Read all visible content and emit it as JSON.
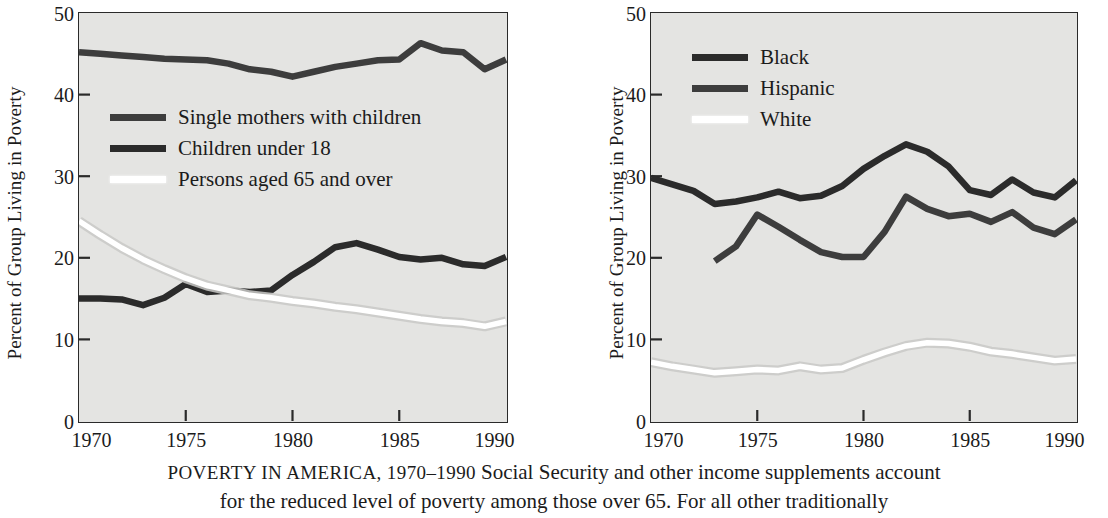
{
  "figure": {
    "caption_heading": "POVERTY IN AMERICA, 1970–1990",
    "caption_body_line1": "Social Security and other income supplements account",
    "caption_body_line2": "for the reduced level of poverty among those over 65. For all other traditionally"
  },
  "colors": {
    "plot_background": "#e4e4e2",
    "axis": "#2a2a2a",
    "series_dark": "#2b2b2b",
    "series_mid": "#3d3d3d",
    "series_white": "#ffffff",
    "text": "#1b1b1b"
  },
  "chart_data": [
    {
      "id": "left",
      "type": "line",
      "title": "",
      "xlabel": "",
      "ylabel": "Percent of Group Living in Poverty",
      "xlim": [
        1970,
        1990
      ],
      "ylim": [
        0,
        50
      ],
      "xticks": [
        1970,
        1975,
        1980,
        1985,
        1990
      ],
      "yticks": [
        0,
        10,
        20,
        30,
        40,
        50
      ],
      "xtick_labels": [
        "1970",
        "1975",
        "1980",
        "1985",
        "1990"
      ],
      "ytick_labels": [
        "0",
        "10",
        "20",
        "30",
        "40",
        "50"
      ],
      "grid": false,
      "legend_position": "upper-left-inside",
      "series": [
        {
          "name": "Single mothers with children",
          "color": "#3d3d3d",
          "x": [
            1970,
            1971,
            1972,
            1973,
            1974,
            1975,
            1976,
            1977,
            1978,
            1979,
            1980,
            1981,
            1982,
            1983,
            1984,
            1985,
            1986,
            1987,
            1988,
            1989,
            1990
          ],
          "values": [
            45.2,
            45.0,
            44.8,
            44.6,
            44.4,
            44.3,
            44.2,
            43.8,
            43.1,
            42.8,
            42.2,
            42.8,
            43.4,
            43.8,
            44.2,
            44.3,
            46.3,
            45.4,
            45.2,
            43.1,
            44.3
          ]
        },
        {
          "name": "Children under 18",
          "color": "#2b2b2b",
          "x": [
            1970,
            1971,
            1972,
            1973,
            1974,
            1975,
            1976,
            1977,
            1978,
            1979,
            1980,
            1981,
            1982,
            1983,
            1984,
            1985,
            1986,
            1987,
            1988,
            1989,
            1990
          ],
          "values": [
            15.0,
            15.0,
            14.9,
            14.2,
            15.1,
            16.8,
            15.8,
            16.0,
            15.8,
            16.0,
            17.9,
            19.5,
            21.3,
            21.8,
            21.0,
            20.1,
            19.8,
            20.0,
            19.2,
            19.0,
            20.1
          ]
        },
        {
          "name": "Persons aged 65 and over",
          "color": "#ffffff",
          "x": [
            1970,
            1971,
            1972,
            1973,
            1974,
            1975,
            1976,
            1977,
            1978,
            1979,
            1980,
            1981,
            1982,
            1983,
            1984,
            1985,
            1986,
            1987,
            1988,
            1989,
            1990
          ],
          "values": [
            24.5,
            22.8,
            21.2,
            19.8,
            18.6,
            17.5,
            16.6,
            16.0,
            15.4,
            15.1,
            14.7,
            14.4,
            14.0,
            13.7,
            13.3,
            12.9,
            12.5,
            12.2,
            12.0,
            11.6,
            12.2
          ]
        }
      ]
    },
    {
      "id": "right",
      "type": "line",
      "title": "",
      "xlabel": "",
      "ylabel": "Percent of Group Living in Poverty",
      "xlim": [
        1970,
        1990
      ],
      "ylim": [
        0,
        50
      ],
      "xticks": [
        1970,
        1975,
        1980,
        1985,
        1990
      ],
      "yticks": [
        0,
        10,
        20,
        30,
        40,
        50
      ],
      "xtick_labels": [
        "1970",
        "1975",
        "1980",
        "1985",
        "1990"
      ],
      "ytick_labels": [
        "0",
        "10",
        "20",
        "30",
        "40",
        "50"
      ],
      "grid": false,
      "legend_position": "upper-left-inside",
      "series": [
        {
          "name": "Black",
          "color": "#2b2b2b",
          "x": [
            1970,
            1971,
            1972,
            1973,
            1974,
            1975,
            1976,
            1977,
            1978,
            1979,
            1980,
            1981,
            1982,
            1983,
            1984,
            1985,
            1986,
            1987,
            1988,
            1989,
            1990
          ],
          "values": [
            29.8,
            29.0,
            28.2,
            26.6,
            26.9,
            27.4,
            28.1,
            27.3,
            27.6,
            28.8,
            30.9,
            32.5,
            33.9,
            33.0,
            31.2,
            28.3,
            27.7,
            29.6,
            28.0,
            27.4,
            29.5
          ]
        },
        {
          "name": "Hispanic",
          "color": "#3d3d3d",
          "x": [
            1973,
            1974,
            1975,
            1976,
            1977,
            1978,
            1979,
            1980,
            1981,
            1982,
            1983,
            1984,
            1985,
            1986,
            1987,
            1988,
            1989,
            1990
          ],
          "values": [
            19.6,
            21.4,
            25.3,
            23.8,
            22.2,
            20.7,
            20.1,
            20.1,
            23.2,
            27.5,
            26.0,
            25.1,
            25.4,
            24.4,
            25.6,
            23.7,
            22.9,
            24.7
          ]
        },
        {
          "name": "White",
          "color": "#ffffff",
          "x": [
            1970,
            1971,
            1972,
            1973,
            1974,
            1975,
            1976,
            1977,
            1978,
            1979,
            1980,
            1981,
            1982,
            1983,
            1984,
            1985,
            1986,
            1987,
            1988,
            1989,
            1990
          ],
          "values": [
            7.2,
            6.7,
            6.3,
            5.9,
            6.1,
            6.3,
            6.2,
            6.7,
            6.3,
            6.5,
            7.5,
            8.4,
            9.2,
            9.6,
            9.5,
            9.1,
            8.5,
            8.2,
            7.8,
            7.4,
            7.6
          ]
        }
      ]
    }
  ]
}
